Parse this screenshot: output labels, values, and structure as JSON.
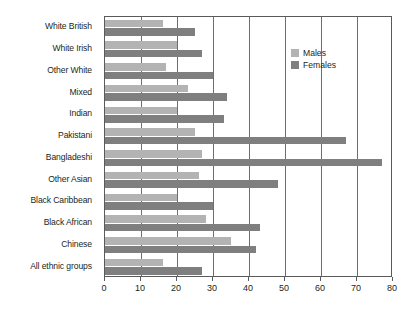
{
  "chart_data": {
    "type": "bar",
    "orientation": "horizontal",
    "title": "",
    "xlabel": "",
    "ylabel": "",
    "xlim": [
      0,
      80
    ],
    "xticks": [
      0,
      10,
      20,
      30,
      40,
      50,
      60,
      70,
      80
    ],
    "xtick_labels": [
      "0",
      "10",
      "20",
      "30",
      "40",
      "50",
      "60",
      "70",
      "80"
    ],
    "grid": "vertical",
    "legend_position": "upper-right-inside",
    "categories": [
      "White British",
      "White Irish",
      "Other White",
      "Mixed",
      "Indian",
      "Pakistani",
      "Bangladeshi",
      "Other Asian",
      "Black Caribbean",
      "Black African",
      "Chinese",
      "All ethnic groups"
    ],
    "series": [
      {
        "name": "Males",
        "color": "#b3b3b3",
        "values": [
          16,
          20,
          17,
          23,
          20,
          25,
          27,
          26,
          20,
          28,
          35,
          16
        ]
      },
      {
        "name": "Females",
        "color": "#7f7f7f",
        "values": [
          25,
          27,
          30,
          34,
          33,
          67,
          77,
          48,
          30,
          43,
          42,
          27
        ]
      }
    ]
  },
  "legend": {
    "items": [
      {
        "label": "Males",
        "color": "#b3b3b3"
      },
      {
        "label": "Females",
        "color": "#7f7f7f"
      }
    ]
  }
}
